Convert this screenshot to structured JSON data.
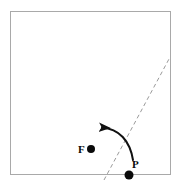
{
  "figure": {
    "background_color": "#ffffff",
    "sheet": {
      "name": "square-sheet",
      "stroke_color": "#a9a9a9",
      "stroke_width": 1,
      "x": 10,
      "y": 11,
      "width": 161,
      "height": 164
    },
    "fold_line": {
      "name": "fold-crease-dashed-line",
      "stroke_color": "#9a9a9a",
      "stroke_width": 1,
      "dash_pattern": "4 3",
      "x1": 104,
      "y1": 180,
      "x2": 169,
      "y2": 59
    },
    "fold_arrow": {
      "name": "fold-direction-arrow",
      "stroke_color": "#111111",
      "stroke_width": 2,
      "path": "M 133 160 C 130 140 118 128 101 127",
      "arrowhead_tip_x": 100,
      "arrowhead_tip_y": 127
    },
    "points": [
      {
        "id": "F",
        "label": "F",
        "label_x": 78,
        "label_y": 153,
        "dot_x": 91,
        "dot_y": 149,
        "dot_radius": 4,
        "dot_color": "#0a0a0a"
      },
      {
        "id": "P",
        "label": "P",
        "label_x": 132,
        "label_y": 168,
        "dot_x": 129,
        "dot_y": 175,
        "dot_radius": 4.5,
        "dot_color": "#0a0a0a"
      }
    ]
  }
}
